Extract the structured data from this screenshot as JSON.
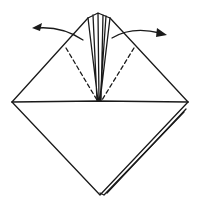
{
  "diagram": {
    "type": "origami-fold-instruction",
    "stroke_color": "#1a1a1a",
    "background": "#ffffff",
    "elements": [
      {
        "name": "paper-outline",
        "kind": "solid-line"
      },
      {
        "name": "horizontal-fold-edge",
        "kind": "solid-line"
      },
      {
        "name": "center-flaps",
        "kind": "solid-line"
      },
      {
        "name": "valley-fold-left",
        "kind": "dashed-line"
      },
      {
        "name": "valley-fold-right",
        "kind": "dashed-line"
      },
      {
        "name": "arrow-fold-left",
        "kind": "arrow",
        "direction": "left"
      },
      {
        "name": "arrow-fold-right",
        "kind": "arrow",
        "direction": "right"
      },
      {
        "name": "back-layer-edge",
        "kind": "solid-line"
      }
    ]
  }
}
